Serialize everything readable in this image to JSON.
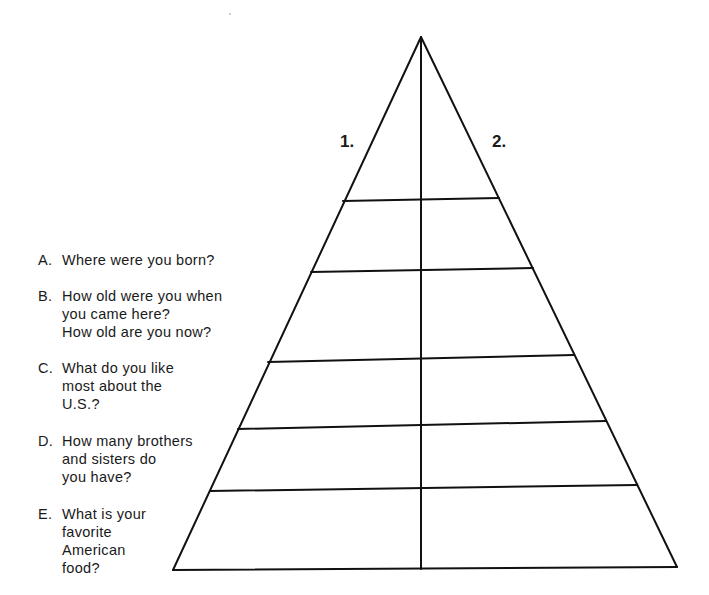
{
  "diagram": {
    "type": "pyramid-worksheet",
    "column_labels": [
      "1.",
      "2."
    ],
    "questions": [
      {
        "letter": "A.",
        "lines": "Where were you born?"
      },
      {
        "letter": "B.",
        "lines": "How old were you when\nyou came here?\nHow old are you now?"
      },
      {
        "letter": "C.",
        "lines": "What do you like\nmost about the\nU.S.?"
      },
      {
        "letter": "D.",
        "lines": "How many brothers\nand sisters do\nyou have?"
      },
      {
        "letter": "E.",
        "lines": "What is your\nfavorite\nAmerican\nfood?"
      }
    ],
    "line_color": "#111111"
  }
}
